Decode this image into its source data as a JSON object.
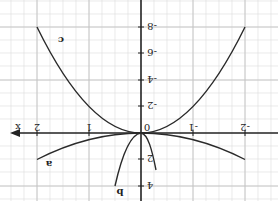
{
  "graph": {
    "orientation": "rotated 180 degrees",
    "axis_label_x": "x",
    "x_ticks": [
      {
        "value": "-2",
        "label": "-2"
      },
      {
        "value": "-1",
        "label": "-1"
      },
      {
        "value": "0",
        "label": "0"
      },
      {
        "value": "1",
        "label": "1"
      },
      {
        "value": "2",
        "label": "2"
      }
    ],
    "y_ticks": [
      {
        "value": "-8",
        "label": "-8"
      },
      {
        "value": "-6",
        "label": "-6"
      },
      {
        "value": "-4",
        "label": "-4"
      },
      {
        "value": "-2",
        "label": "-2"
      },
      {
        "value": "2",
        "label": "2"
      },
      {
        "value": "4",
        "label": "4"
      }
    ],
    "curves": [
      {
        "name": "a",
        "label": "a",
        "description": "wide parabola through origin, value 2 at x=±2"
      },
      {
        "name": "b",
        "label": "b",
        "description": "narrow parabola through origin, value 4 at x≈±0.5"
      },
      {
        "name": "c",
        "label": "c",
        "description": "parabola through origin, value -8 at x=±2"
      }
    ],
    "colors": {
      "grid": "#d9d9d9",
      "axis": "#222222",
      "curve": "#2a2a2a"
    }
  }
}
